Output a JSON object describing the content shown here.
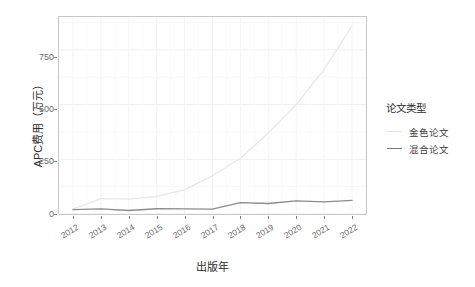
{
  "chart_data": {
    "type": "line",
    "title": "",
    "xlabel": "出版年",
    "ylabel": "APC费用（万元）",
    "x": [
      2012,
      2013,
      2014,
      2015,
      2016,
      2017,
      2018,
      2019,
      2020,
      2021,
      2022
    ],
    "xticklabels": [
      "2012",
      "2013",
      "2014",
      "2015",
      "2016",
      "2017",
      "2018",
      "2019",
      "2020",
      "2021",
      "2022"
    ],
    "yticklabels": [
      "0",
      "250",
      "500",
      "750"
    ],
    "yticks": [
      0,
      250,
      500,
      750
    ],
    "xlim": [
      2011.5,
      2022.5
    ],
    "ylim": [
      0,
      900
    ],
    "grid": true,
    "legend_position": "right",
    "legend_title": "论文类型",
    "series": [
      {
        "name": "金色论文",
        "color": "#e8e8e8",
        "values": [
          22,
          70,
          68,
          80,
          110,
          175,
          255,
          370,
          500,
          660,
          860
        ]
      },
      {
        "name": "混合论文",
        "color": "#8c8c8c",
        "values": [
          20,
          23,
          16,
          24,
          23,
          22,
          52,
          48,
          60,
          55,
          62
        ]
      }
    ]
  },
  "axes": {
    "y_title": "APC费用（万元）",
    "x_title": "出版年",
    "y_tick_labels": [
      "750",
      "500",
      "250",
      "0"
    ],
    "x_tick_labels": [
      "2012",
      "2013",
      "2014",
      "2015",
      "2016",
      "2017",
      "2018",
      "2019",
      "2020",
      "2021",
      "2022"
    ]
  },
  "legend": {
    "title": "论文类型",
    "items": [
      {
        "label": "金色论文",
        "color": "#e2e2e2"
      },
      {
        "label": "混合论文",
        "color": "#7a7a7a"
      }
    ]
  },
  "colors": {
    "panel_border": "#c8c8c8",
    "grid": "#f2f2f2",
    "gold_series": "#e2e2e2",
    "hybrid_series": "#7a7a7a",
    "text": "#4d4d4d",
    "background": "#ffffff"
  }
}
